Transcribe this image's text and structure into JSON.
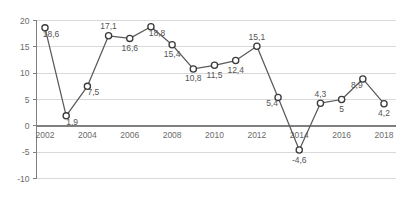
{
  "chart_data": {
    "type": "line",
    "title": "",
    "subtitle": "",
    "xlabel": "",
    "ylabel": "",
    "xlim": [
      2001.4,
      2018.8
    ],
    "ylim": [
      -10,
      20
    ],
    "yticks": [
      20,
      15,
      10,
      5,
      0,
      -5,
      -10
    ],
    "ytick_labels": [
      "20",
      "15",
      "10",
      "5",
      "0",
      "-5",
      "-10"
    ],
    "xticks": [
      2002,
      2004,
      2006,
      2008,
      2010,
      2012,
      2014,
      2016,
      2018
    ],
    "xtick_labels": [
      "2002",
      "2004",
      "2006",
      "2008",
      "2010",
      "2012",
      "2014",
      "2016",
      "2018"
    ],
    "grid": true,
    "grid_axis": "y",
    "legend": null,
    "legend_position": "none",
    "decimal_separator": ",",
    "marker": "circle-open",
    "series": [
      {
        "name": "",
        "color": "#5a5a5a",
        "x": [
          2002,
          2003,
          2004,
          2005,
          2006,
          2007,
          2008,
          2009,
          2010,
          2011,
          2012,
          2013,
          2014,
          2015,
          2016,
          2017,
          2018
        ],
        "values": [
          18.6,
          1.9,
          7.5,
          17.1,
          16.6,
          18.8,
          15.4,
          10.8,
          11.5,
          12.4,
          15.1,
          5.4,
          -4.6,
          4.3,
          5.0,
          8.9,
          4.2
        ],
        "point_labels": [
          "18,6",
          "1,9",
          "7,5",
          "17,1",
          "16,6",
          "18,8",
          "15,4",
          "10,8",
          "11,5",
          "12,4",
          "15,1",
          "5,4",
          "-4,6",
          "4,3",
          "5",
          "8,9",
          "4,2"
        ],
        "label_placement": [
          "below-right",
          "below-right",
          "below-right",
          "above",
          "below",
          "below-right",
          "below",
          "below",
          "below",
          "below",
          "above",
          "below-left",
          "below",
          "above",
          "below",
          "below-left",
          "below"
        ]
      }
    ]
  },
  "colors": {
    "line": "#5a5a5a",
    "marker_stroke": "#3a3a3a",
    "marker_fill": "#ffffff",
    "gridline": "#d9d9d9",
    "axis": "#808080",
    "tick_text": "#6b6b6b",
    "label_text": "#555555",
    "background": "#ffffff"
  }
}
